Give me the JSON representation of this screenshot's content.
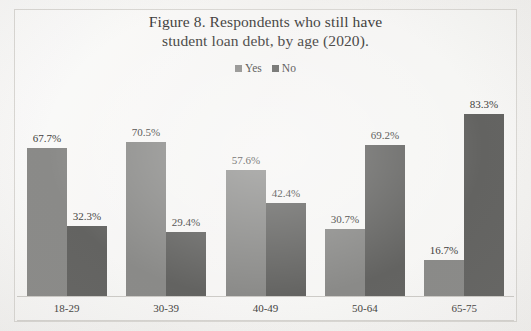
{
  "figure": {
    "title_line1": "Figure 8. Respondents who still have",
    "title_line2": "student loan debt, by age (2020)."
  },
  "colors": {
    "yes": "#8a8a88",
    "no": "#636361",
    "background": "#f3f2f0",
    "frame": "#d9d7d3",
    "text": "#3e3d3b"
  },
  "chart_data": {
    "type": "bar",
    "title": "Figure 8. Respondents who still have student loan debt, by age (2020).",
    "xlabel": "",
    "ylabel": "",
    "ylim": [
      0,
      100
    ],
    "grid": false,
    "legend_position": "top",
    "categories": [
      "18-29",
      "30-39",
      "40-49",
      "50-64",
      "65-75"
    ],
    "series": [
      {
        "name": "Yes",
        "color": "#8a8a88",
        "values": [
          67.7,
          70.5,
          57.6,
          30.7,
          16.7
        ],
        "labels": [
          "67.7%",
          "70.5%",
          "57.6%",
          "30.7%",
          "16.7%"
        ]
      },
      {
        "name": "No",
        "color": "#636361",
        "values": [
          32.3,
          29.4,
          42.4,
          69.2,
          83.3
        ],
        "labels": [
          "32.3%",
          "29.4%",
          "42.4%",
          "69.2%",
          "83.3%"
        ]
      }
    ]
  }
}
